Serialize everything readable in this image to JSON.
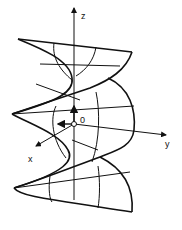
{
  "diagram": {
    "axes": {
      "z_label": "z",
      "y_label": "y",
      "x_label": "x",
      "origin_label": "0"
    },
    "colors": {
      "line": "#111111",
      "background": "#ffffff"
    }
  }
}
